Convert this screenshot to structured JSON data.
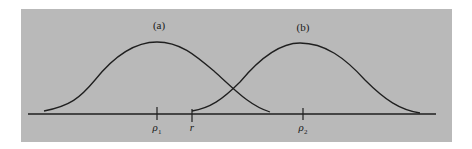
{
  "figure": {
    "curves": [
      {
        "id": "a",
        "label": "(a)",
        "peak_label": "ρ1"
      },
      {
        "id": "b",
        "label": "(b)",
        "peak_label": "ρ2"
      }
    ],
    "axis_ticks": [
      {
        "id": "rho1",
        "symbol": "ρ",
        "subscript": "1"
      },
      {
        "id": "r",
        "symbol": "r",
        "subscript": ""
      },
      {
        "id": "rho2",
        "symbol": "ρ",
        "subscript": "2"
      }
    ],
    "colors": {
      "background": "#b9b9b9",
      "stroke": "#1f1f1f"
    }
  }
}
